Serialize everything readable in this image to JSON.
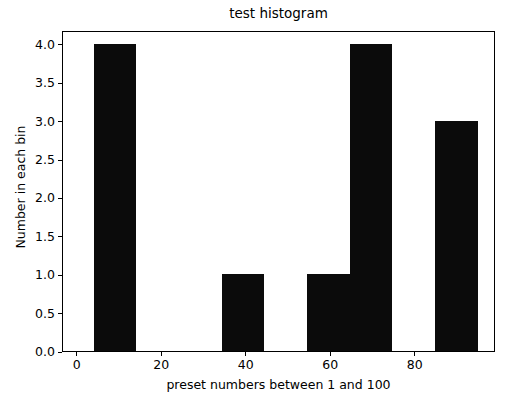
{
  "chart_data": {
    "type": "bar",
    "title": "test histogram",
    "xlabel": "preset numbers between 1 and 100",
    "ylabel": "Number in each bin",
    "xlim": [
      -3.5,
      99.0
    ],
    "ylim": [
      0,
      4.18
    ],
    "grid": false,
    "legend": null,
    "bar_color": "#0b0b0b",
    "background_color": "#ffffff",
    "axis_color": "#000000",
    "xticks": [
      {
        "value": 0,
        "label": "0"
      },
      {
        "value": 20,
        "label": "20"
      },
      {
        "value": 40,
        "label": "40"
      },
      {
        "value": 60,
        "label": "60"
      },
      {
        "value": 80,
        "label": "80"
      }
    ],
    "yticks": [
      {
        "value": 0.0,
        "label": "0.0"
      },
      {
        "value": 0.5,
        "label": "0.5"
      },
      {
        "value": 1.0,
        "label": "1.0"
      },
      {
        "value": 1.5,
        "label": "1.5"
      },
      {
        "value": 2.0,
        "label": "2.0"
      },
      {
        "value": 2.5,
        "label": "2.5"
      },
      {
        "value": 3.0,
        "label": "3.0"
      },
      {
        "value": 3.5,
        "label": "3.5"
      },
      {
        "value": 4.0,
        "label": "4.0"
      }
    ],
    "bin_edges": [
      3.8,
      13.9,
      24.0,
      34.1,
      44.2,
      54.3,
      64.4,
      74.5,
      84.6,
      94.7
    ],
    "bins": [
      {
        "x0": 3.8,
        "x1": 13.9,
        "value": 4
      },
      {
        "x0": 13.9,
        "x1": 24.0,
        "value": 0
      },
      {
        "x0": 24.0,
        "x1": 34.1,
        "value": 0
      },
      {
        "x0": 34.1,
        "x1": 44.2,
        "value": 1
      },
      {
        "x0": 44.2,
        "x1": 54.3,
        "value": 0
      },
      {
        "x0": 54.3,
        "x1": 64.4,
        "value": 1
      },
      {
        "x0": 64.4,
        "x1": 74.5,
        "value": 4
      },
      {
        "x0": 74.5,
        "x1": 84.6,
        "value": 0
      },
      {
        "x0": 84.6,
        "x1": 94.7,
        "value": 3
      }
    ],
    "values": [
      4,
      0,
      0,
      1,
      0,
      1,
      4,
      0,
      3
    ],
    "categories": [
      "3.8-13.9",
      "13.9-24.0",
      "24.0-34.1",
      "34.1-44.2",
      "44.2-54.3",
      "54.3-64.4",
      "64.4-74.5",
      "74.5-84.6",
      "84.6-94.7"
    ]
  }
}
